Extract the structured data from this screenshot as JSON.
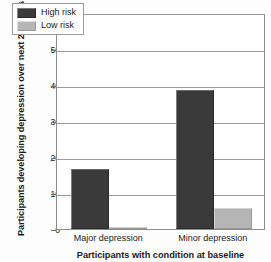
{
  "chart_data": {
    "type": "bar",
    "title": "",
    "subtitle": "",
    "xlabel": "Participants with condition at baseline",
    "ylabel": "Participants developing depression over next 2.5 years (%)",
    "categories": [
      "Major depression",
      "Minor depression"
    ],
    "series": [
      {
        "name": "High risk",
        "color": "#3a3a3a",
        "values": [
          16.8,
          38.6
        ]
      },
      {
        "name": "Low risk",
        "color": "#b5b5b5",
        "values": [
          0.6,
          5.9
        ]
      }
    ],
    "ylim": [
      0,
      60
    ],
    "yticks": [
      0,
      10,
      20,
      30,
      40,
      50,
      60
    ],
    "ytick_labels": [
      "0",
      "10",
      "20",
      "30",
      "40",
      "50",
      "60"
    ],
    "grid": "horizontal",
    "legend_position": "top-left-inside",
    "legend_entries": [
      "High risk",
      "Low risk"
    ],
    "annotations": []
  },
  "axis": {
    "y_title": "Participants developing depression over next 2.5 years (%)",
    "x_title": "Participants with condition at baseline"
  },
  "colors": {
    "high_risk": "#3a3a3a",
    "low_risk": "#b5b5b5",
    "gridline": "#9b9b9b",
    "frame": "#8c8c8c",
    "text": "#1a1a1a",
    "background": "#ffffff"
  }
}
